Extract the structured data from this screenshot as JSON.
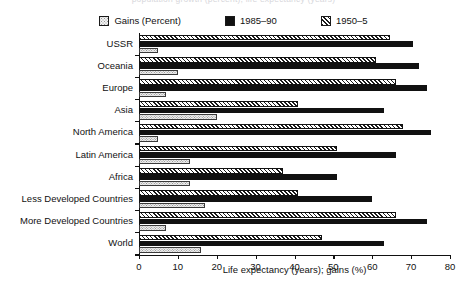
{
  "top_clipped_text": "population growth (percent); life expectancy (years)",
  "legend": {
    "items": [
      {
        "label": "Gains (Percent)",
        "swatch": "dotted-light-swatch-icon",
        "color": "#ededed"
      },
      {
        "label": "1985–90",
        "swatch": "solid-black-swatch-icon",
        "color": "#111111"
      },
      {
        "label": "1950–5",
        "swatch": "diagonal-hatch-swatch-icon",
        "color": "#ffffff"
      }
    ]
  },
  "chart_data": {
    "type": "bar",
    "orientation": "horizontal",
    "title": "",
    "xlabel": "Life expectancy (years); gains (%)",
    "ylabel": "",
    "xlim": [
      0,
      80
    ],
    "xticks": [
      0,
      10,
      20,
      30,
      40,
      50,
      60,
      70,
      80
    ],
    "grid": false,
    "legend_position": "top-center",
    "categories": [
      "USSR",
      "Oceania",
      "Europe",
      "Asia",
      "North America",
      "Latin America",
      "Africa",
      "Less Developed Countries",
      "More Developed Countries",
      "World"
    ],
    "series": [
      {
        "name": "1950–5",
        "values": [
          64.5,
          61.0,
          66.0,
          41.0,
          68.0,
          51.0,
          37.0,
          41.0,
          66.0,
          47.0
        ]
      },
      {
        "name": "1985–90",
        "values": [
          70.5,
          72.0,
          74.0,
          63.0,
          75.0,
          66.0,
          51.0,
          60.0,
          74.0,
          63.0
        ]
      },
      {
        "name": "Gains (Percent)",
        "values": [
          5.0,
          10.0,
          7.0,
          20.0,
          5.0,
          13.0,
          13.0,
          17.0,
          7.0,
          16.0
        ]
      }
    ]
  }
}
